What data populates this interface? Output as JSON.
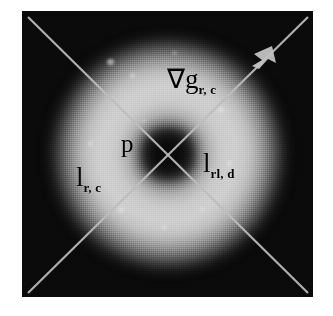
{
  "figure": {
    "kind": "grayscale-scientific-image",
    "panel": {
      "background_color": "#0a0a0a",
      "ring_color": "#d8d8d8",
      "core_color": "#0a0a0a",
      "line_color": "#b9b9b9"
    },
    "annotations": [
      {
        "name": "gradient-label",
        "base": "∇g",
        "subscript": "r, c",
        "meaning": "gradient vector at row r column c"
      },
      {
        "name": "point-label",
        "base": "p",
        "subscript": "",
        "meaning": "point p at the crossing of the two lines"
      },
      {
        "name": "left-line-label",
        "base": "l",
        "subscript": "r, c",
        "meaning": "line l at row r column c"
      },
      {
        "name": "right-line-label",
        "base": "l",
        "subscript": "rl, d",
        "meaning": "line l rl d"
      }
    ],
    "lines": [
      {
        "name": "diagonal-line-nw-se",
        "from": [
          30,
          20
        ],
        "to": [
          284,
          272
        ],
        "arrow": false
      },
      {
        "name": "diagonal-line-sw-ne",
        "from": [
          30,
          272
        ],
        "to": [
          284,
          20
        ],
        "arrow": true
      }
    ],
    "arrow": {
      "name": "gradient-arrowhead",
      "at": [
        246,
        44
      ]
    }
  }
}
